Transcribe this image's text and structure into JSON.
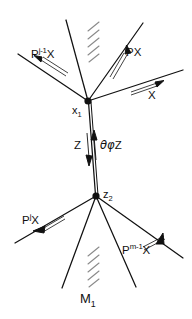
{
  "figure": {
    "caption_label": "M",
    "caption_sub": "1",
    "background_color": "#ffffff",
    "ink_color": "#111111"
  },
  "vertices": [
    {
      "id": "x1",
      "base": "x",
      "sub": "1",
      "cx": 88,
      "cy": 101,
      "r": 3.4
    },
    {
      "id": "z2",
      "base": "z",
      "sub": "2",
      "cx": 96,
      "cy": 196,
      "r": 3.4
    }
  ],
  "edge_labels": {
    "upper_left_outer": {
      "base": "P",
      "sup": "j-1",
      "tail": "X"
    },
    "upper_right": {
      "base": "P",
      "sup": "",
      "tail": "X"
    },
    "upper_far_right": {
      "base": "",
      "sup": "",
      "tail": "X"
    },
    "middle_down": {
      "base": "",
      "sup": "",
      "tail": "Z"
    },
    "middle_up": {
      "greek": "θφ",
      "tail": "Z"
    },
    "lower_left": {
      "base": "P",
      "sup": "j",
      "tail": "X"
    },
    "lower_right": {
      "base": "P",
      "sup": "m-1",
      "tail": "X"
    }
  },
  "hatching": [
    {
      "id": "upper-hatch",
      "x": 86,
      "y": 22,
      "strokes": 5
    },
    {
      "id": "lower-hatch",
      "x": 88,
      "y": 246,
      "strokes": 5
    }
  ],
  "geometry": {
    "upper_edges": [
      {
        "name": "edge-p-j-minus-1-x",
        "x1": 88,
        "y1": 101,
        "x2": 18,
        "y2": 54
      },
      {
        "name": "edge-upper-steep",
        "x1": 88,
        "y1": 101,
        "x2": 66,
        "y2": 20
      },
      {
        "name": "edge-p-x",
        "x1": 88,
        "y1": 101,
        "x2": 143,
        "y2": 23
      },
      {
        "name": "edge-x",
        "x1": 88,
        "y1": 101,
        "x2": 183,
        "y2": 70
      }
    ],
    "middle_edges": [
      {
        "name": "edge-z-spine-left",
        "x1": 88,
        "y1": 101,
        "x2": 96,
        "y2": 196
      },
      {
        "name": "edge-z-spine-right",
        "x1": 91,
        "y1": 101,
        "x2": 98,
        "y2": 196
      }
    ],
    "lower_edges": [
      {
        "name": "edge-p-j-x",
        "x1": 96,
        "y1": 196,
        "x2": 15,
        "y2": 243
      },
      {
        "name": "edge-lower-steep",
        "x1": 96,
        "y1": 196,
        "x2": 62,
        "y2": 288
      },
      {
        "name": "edge-p-m-minus-1-x",
        "x1": 96,
        "y1": 196,
        "x2": 136,
        "y2": 287
      },
      {
        "name": "edge-lower-right",
        "x1": 96,
        "y1": 196,
        "x2": 183,
        "y2": 258
      }
    ]
  }
}
